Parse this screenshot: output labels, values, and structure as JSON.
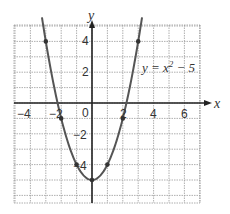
{
  "chart_data": {
    "type": "line",
    "title": "",
    "xlabel": "x",
    "ylabel": "y",
    "xlim": [
      -5,
      7
    ],
    "ylim": [
      -6,
      5
    ],
    "grid": true,
    "x_ticks": [
      "-4",
      "-2",
      "0",
      "2",
      "4",
      "6"
    ],
    "y_ticks": [
      "4",
      "2",
      "-2",
      "-4"
    ],
    "series": [
      {
        "name": "y = x² − 5",
        "function": "x^2 - 5",
        "x": [
          -3,
          -2,
          -1,
          0,
          1,
          2,
          3
        ],
        "y": [
          4,
          -1,
          -4,
          -5,
          -4,
          -1,
          4
        ],
        "marked_points": [
          [
            -3,
            4
          ],
          [
            -2,
            -1
          ],
          [
            -1,
            -4
          ],
          [
            0,
            -5
          ],
          [
            1,
            -4
          ],
          [
            2,
            -1
          ],
          [
            3,
            4
          ]
        ],
        "color": "#555555"
      }
    ],
    "annotations": [
      {
        "text": "y = x² − 5",
        "x": 3.6,
        "y": 2.3
      }
    ]
  },
  "labels": {
    "x_axis": "x",
    "y_axis": "y",
    "equation": "y = x",
    "equation_exp": "2",
    "equation_tail": " − 5",
    "tick_x_m4": "−4",
    "tick_x_m2": "−2",
    "tick_x_0": "0",
    "tick_x_2": "2",
    "tick_x_4": "4",
    "tick_x_6": "6",
    "tick_y_4": "4",
    "tick_y_2": "2",
    "tick_y_m2": "−2",
    "tick_y_m4": "−4"
  }
}
